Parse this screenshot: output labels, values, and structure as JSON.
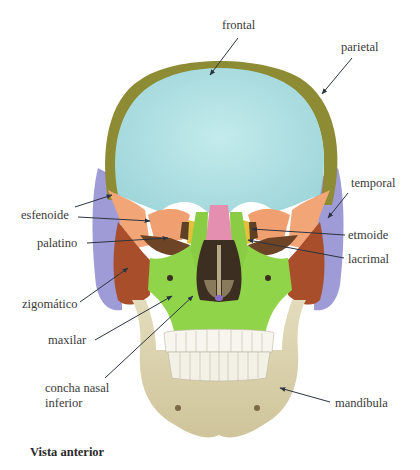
{
  "figure": {
    "view": "anterior",
    "caption": "Vista anterior",
    "colors": {
      "frontal": "#a9dde0",
      "parietal": "#8b8a32",
      "temporal": "#9d9ad6",
      "esfenoide": "#f0a57a",
      "etmoide": "#e5c23d",
      "lacrimal": "#6b4a2a",
      "palatino": "#7a4e2c",
      "zigomatico": "#a84d2a",
      "maxilar": "#8fd44a",
      "nasal": "#e58fb0",
      "concha_nasal_inferior": "#4a3b2a",
      "mandibula": "#d8cfa8",
      "teeth": "#f7f5ee"
    }
  },
  "labels": {
    "frontal": "frontal",
    "parietal": "parietal",
    "temporal": "temporal",
    "esfenoide": "esfenoide",
    "etmoide": "etmoide",
    "palatino": "palatino",
    "lacrimal": "lacrimal",
    "zigomatico": "zigomático",
    "maxilar": "maxilar",
    "concha_line1": "concha nasal",
    "concha_line2": "inferior",
    "mandibula": "mandíbula"
  }
}
